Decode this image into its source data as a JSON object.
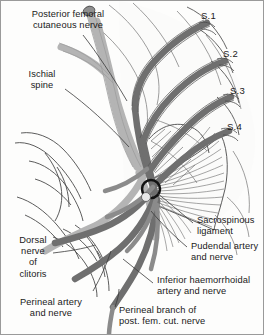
{
  "figure": {
    "background_color": "#fdfdfc",
    "border_color": "#9a9a9a"
  },
  "palette": {
    "nerve_dark": "#6f6f6f",
    "nerve_mid": "#8b8b8b",
    "artery_light": "#b4b4b4",
    "outline": "#4a4a4a",
    "hatch": "#6a6a6a",
    "leader": "#3a3a3a",
    "text": "#1a1a1a"
  },
  "labels": {
    "posterior_femoral": "Posterior femoral\ncutaneous nerve",
    "ischial_spine": "Ischial\nspine",
    "dorsal_nerve_clitoris": "Dorsal\nnerve\nof\nclitoris",
    "perineal_artery": "Perineal artery\nand nerve",
    "sacrospinous": "Sacrospinous\nligament",
    "pudendal": "Pudendal artery\nand nerve",
    "inferior_haemorrhoidal": "Inferior haemorrhoidal\nartery and nerve",
    "perineal_branch": "Perineal branch of\npost. fem. cut. nerve"
  },
  "sacral_roots": [
    {
      "name": "S.1",
      "label": "S.1"
    },
    {
      "name": "S.2",
      "label": "S.2"
    },
    {
      "name": "S.3",
      "label": "S.3"
    },
    {
      "name": "S.4",
      "label": "S.4"
    }
  ]
}
